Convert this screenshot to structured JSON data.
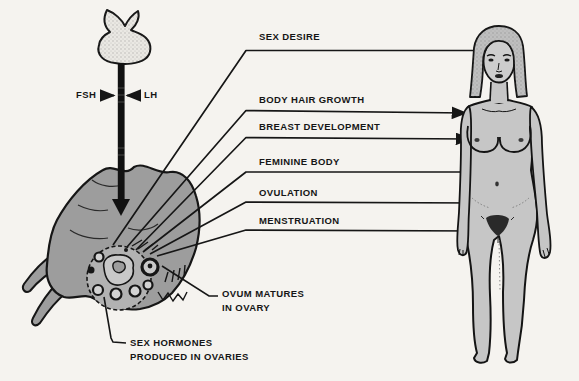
{
  "pituitary": {
    "fsh_label": "FSH",
    "lh_label": "LH"
  },
  "effects": [
    {
      "label": "SEX DESIRE"
    },
    {
      "label": "BODY HAIR GROWTH"
    },
    {
      "label": "BREAST DEVELOPMENT"
    },
    {
      "label": "FEMININE BODY"
    },
    {
      "label": "OVULATION"
    },
    {
      "label": "MENSTRUATION"
    }
  ],
  "callouts": {
    "ovum": {
      "line1": "OVUM MATURES",
      "line2": "IN OVARY"
    },
    "hormones": {
      "line1": "SEX HORMONES",
      "line2": "PRODUCED IN OVARIES"
    }
  },
  "colors": {
    "background": "#f5f3ef",
    "ink": "#161616",
    "body_gray": "#c6c6c6",
    "ovary_gray": "#9d9d9d",
    "follicle_gray": "#d2d2d2"
  }
}
